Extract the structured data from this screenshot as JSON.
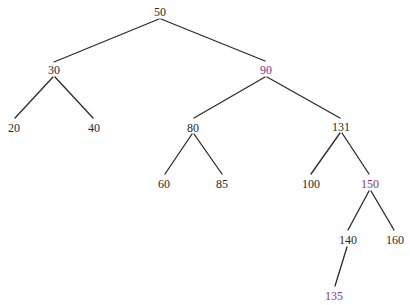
{
  "diagram": {
    "type": "binary-search-tree",
    "colors": {
      "normal": "#2a2a2a",
      "highlight": "#8b2f8f",
      "edge": "#2a2a2a"
    },
    "nodes": [
      {
        "id": "n50",
        "label": "50",
        "x": 160,
        "y": 12,
        "highlight": false
      },
      {
        "id": "n30",
        "label": "30",
        "x": 54,
        "y": 70,
        "highlight": false
      },
      {
        "id": "n90",
        "label": "90",
        "x": 266,
        "y": 70,
        "highlight": true
      },
      {
        "id": "n20",
        "label": "20",
        "x": 14,
        "y": 128,
        "highlight": false
      },
      {
        "id": "n40",
        "label": "40",
        "x": 94,
        "y": 128,
        "highlight": false
      },
      {
        "id": "n80",
        "label": "80",
        "x": 193,
        "y": 128,
        "highlight": false
      },
      {
        "id": "n131",
        "label": "131",
        "x": 341,
        "y": 127,
        "highlight": false
      },
      {
        "id": "n60",
        "label": "60",
        "x": 164,
        "y": 184,
        "highlight": false
      },
      {
        "id": "n85",
        "label": "85",
        "x": 222,
        "y": 184,
        "highlight": false
      },
      {
        "id": "n100",
        "label": "100",
        "x": 311,
        "y": 184,
        "highlight": false
      },
      {
        "id": "n150",
        "label": "150",
        "x": 370,
        "y": 184,
        "highlight": true
      },
      {
        "id": "n140",
        "label": "140",
        "x": 348,
        "y": 240,
        "highlight": false
      },
      {
        "id": "n160",
        "label": "160",
        "x": 395,
        "y": 240,
        "highlight": false
      },
      {
        "id": "n135",
        "label": "135",
        "x": 334,
        "y": 296,
        "highlight": true
      }
    ],
    "edges": [
      {
        "from": "n50",
        "to": "n30",
        "x1": 159,
        "y1": 19,
        "x2": 54,
        "y2": 62
      },
      {
        "from": "n50",
        "to": "n90",
        "x1": 161,
        "y1": 19,
        "x2": 265,
        "y2": 61
      },
      {
        "from": "n30",
        "to": "n20",
        "x1": 53,
        "y1": 77,
        "x2": 15,
        "y2": 118
      },
      {
        "from": "n30",
        "to": "n40",
        "x1": 55,
        "y1": 77,
        "x2": 93,
        "y2": 118
      },
      {
        "from": "n90",
        "to": "n80",
        "x1": 265,
        "y1": 77,
        "x2": 194,
        "y2": 118
      },
      {
        "from": "n90",
        "to": "n131",
        "x1": 267,
        "y1": 77,
        "x2": 340,
        "y2": 118
      },
      {
        "from": "n80",
        "to": "n60",
        "x1": 192,
        "y1": 134,
        "x2": 165,
        "y2": 174
      },
      {
        "from": "n80",
        "to": "n85",
        "x1": 194,
        "y1": 134,
        "x2": 222,
        "y2": 174
      },
      {
        "from": "n131",
        "to": "n100",
        "x1": 340,
        "y1": 133,
        "x2": 311,
        "y2": 174
      },
      {
        "from": "n131",
        "to": "n150",
        "x1": 342,
        "y1": 133,
        "x2": 369,
        "y2": 174
      },
      {
        "from": "n150",
        "to": "n140",
        "x1": 369,
        "y1": 191,
        "x2": 348,
        "y2": 230
      },
      {
        "from": "n150",
        "to": "n160",
        "x1": 371,
        "y1": 191,
        "x2": 394,
        "y2": 230
      },
      {
        "from": "n140",
        "to": "n135",
        "x1": 347,
        "y1": 247,
        "x2": 335,
        "y2": 286
      }
    ]
  }
}
